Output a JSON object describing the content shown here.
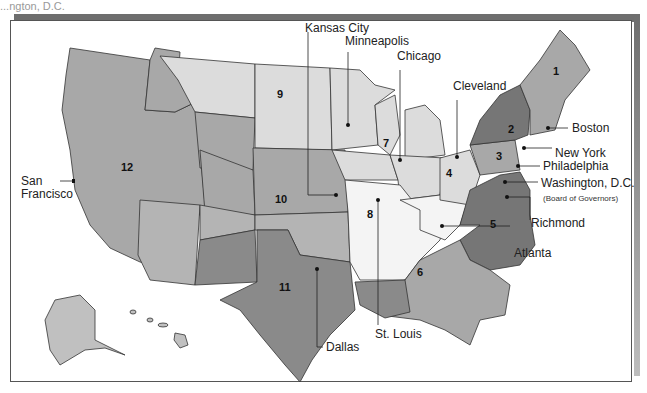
{
  "map": {
    "title": "Federal Reserve Districts",
    "colors": {
      "light": "#dcdcdc",
      "medium_light": "#c8c8c8",
      "medium": "#a8a8a8",
      "dark": "#8a8a8a",
      "darker": "#767676",
      "border": "#333333",
      "frame_shadow": "#6e6e6e"
    },
    "districts": [
      {
        "number": "1",
        "city": "Boston"
      },
      {
        "number": "2",
        "city": "New York"
      },
      {
        "number": "3",
        "city": "Philadelphia"
      },
      {
        "number": "4",
        "city": "Cleveland"
      },
      {
        "number": "5",
        "city": "Richmond"
      },
      {
        "number": "6",
        "city": "Atlanta"
      },
      {
        "number": "7",
        "city": "Chicago"
      },
      {
        "number": "8",
        "city": "St. Louis"
      },
      {
        "number": "9",
        "city": "Minneapolis"
      },
      {
        "number": "10",
        "city": "Kansas City"
      },
      {
        "number": "11",
        "city": "Dallas"
      },
      {
        "number": "12",
        "city": "San Francisco"
      }
    ],
    "city_labels": {
      "kansas_city": "Kansas City",
      "minneapolis": "Minneapolis",
      "chicago": "Chicago",
      "cleveland": "Cleveland",
      "boston": "Boston",
      "new_york": "New York",
      "philadelphia": "Philadelphia",
      "washington": "Washington, D.C.",
      "board": "(Board of Governors)",
      "richmond": "Richmond",
      "atlanta": "Atlanta",
      "dallas": "Dallas",
      "st_louis": "St. Louis",
      "san_francisco_1": "San",
      "san_francisco_2": "Francisco"
    },
    "district_numbers": {
      "d1": "1",
      "d2": "2",
      "d3": "3",
      "d4": "4",
      "d5": "5",
      "d6": "6",
      "d7": "7",
      "d8": "8",
      "d9": "9",
      "d10": "10",
      "d11": "11",
      "d12": "12"
    },
    "top_cut_text": "...ngton, D.C."
  }
}
